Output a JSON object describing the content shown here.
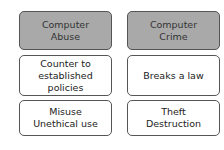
{
  "columns": [
    {
      "header": "Computer\nAbuse",
      "rows": [
        "Counter to\nestablished policies",
        "Misuse\nUnethical use"
      ]
    },
    {
      "header": "Computer\nCrime",
      "rows": [
        "Breaks a law",
        "Theft\nDestruction"
      ]
    }
  ],
  "colors": {
    "header_fill": "#a9a9a9",
    "border": "#555555",
    "background": "#ffffff"
  }
}
